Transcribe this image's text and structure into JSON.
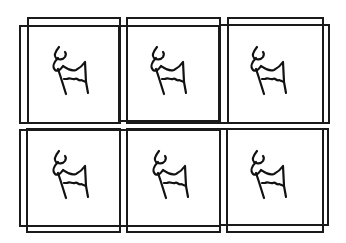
{
  "image": {
    "description": "Grid of six framed hand-drawn goat sketches (2 rows x 3 columns), each drawn inside two slightly offset overlapping square outlines",
    "rows": 2,
    "columns": 3,
    "line_color": "#1a1a1a",
    "background": "#ffffff"
  },
  "cells": [
    {
      "row": 1,
      "col": 1,
      "icon": "goat-icon"
    },
    {
      "row": 1,
      "col": 2,
      "icon": "goat-icon"
    },
    {
      "row": 1,
      "col": 3,
      "icon": "goat-icon"
    },
    {
      "row": 2,
      "col": 1,
      "icon": "goat-icon"
    },
    {
      "row": 2,
      "col": 2,
      "icon": "goat-icon"
    },
    {
      "row": 2,
      "col": 3,
      "icon": "goat-icon"
    }
  ]
}
